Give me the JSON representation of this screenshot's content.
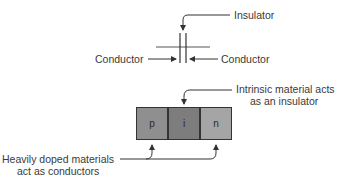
{
  "capacitor": {
    "insulator_label": "Insulator",
    "left_conductor_label": "Conductor",
    "right_conductor_label": "Conductor"
  },
  "pin_diode": {
    "intrinsic_label_line1": "Intrinsic material acts",
    "intrinsic_label_line2": "as an insulator",
    "doped_label_line1": "Heavily doped materials",
    "doped_label_line2": "act as conductors",
    "regions": [
      {
        "label": "p",
        "color": "#8f8f8f"
      },
      {
        "label": "i",
        "color": "#7d7d7d"
      },
      {
        "label": "n",
        "color": "#a5a5a5"
      }
    ]
  }
}
